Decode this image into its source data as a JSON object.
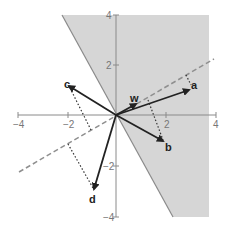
{
  "figure": {
    "colors": {
      "shaded_region": "#d6d6d6",
      "boundary": "#8a8a8a",
      "axis": "#8a8a8a",
      "dashed_line": "#8f8f8f",
      "vector": "#222222",
      "projection": "#333333"
    },
    "axes": {
      "x_ticks": [
        {
          "value": -4,
          "label": "−4"
        },
        {
          "value": -2,
          "label": "−2"
        },
        {
          "value": 2,
          "label": "2"
        },
        {
          "value": 4,
          "label": "4"
        }
      ],
      "y_ticks": [
        {
          "value": 4,
          "label": "4"
        },
        {
          "value": 2,
          "label": "2"
        },
        {
          "value": -2,
          "label": "−2"
        },
        {
          "value": -4,
          "label": "−4"
        }
      ],
      "range": {
        "x": [
          -4,
          4
        ],
        "y": [
          -4,
          4
        ]
      }
    },
    "vectors": [
      {
        "name": "a",
        "label": "a",
        "x": 3,
        "y": 1
      },
      {
        "name": "b",
        "label": "b",
        "x": 1.9,
        "y": -1.1
      },
      {
        "name": "c",
        "label": "c",
        "x": -1.9,
        "y": 1.2
      },
      {
        "name": "d",
        "label": "d",
        "x": -0.9,
        "y": -3
      },
      {
        "name": "w",
        "label": "w",
        "x": 0.8,
        "y": 0.45
      }
    ],
    "shaded_region": {
      "label": "positive half-plane (w·x > 0)"
    },
    "dashed_line": {
      "label": "direction of w"
    }
  }
}
